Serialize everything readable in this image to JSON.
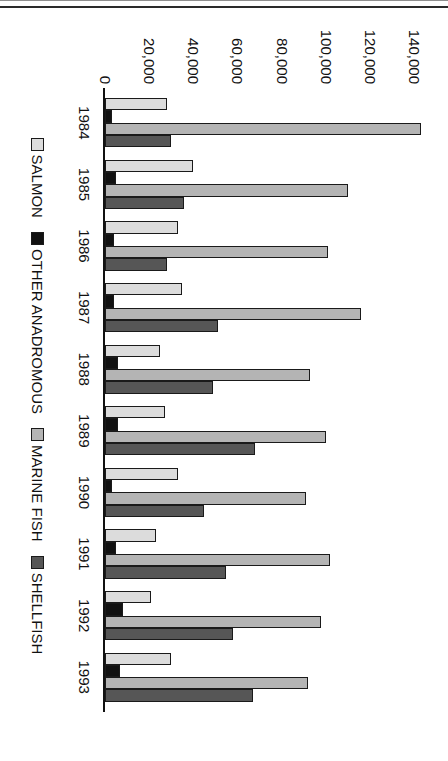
{
  "chart_data": {
    "type": "bar",
    "orientation": "horizontal",
    "title": "",
    "xlabel": "",
    "ylabel": "",
    "categories": [
      "1984",
      "1985",
      "1986",
      "1987",
      "1988",
      "1989",
      "1990",
      "1991",
      "1992",
      "1993"
    ],
    "value_axis_ticks": [
      "0",
      "20,000",
      "40,000",
      "60,000",
      "80,000",
      "100,000",
      "120,000",
      "140,000"
    ],
    "value_axis_tick_values": [
      0,
      20000,
      40000,
      60000,
      80000,
      100000,
      120000,
      140000
    ],
    "ylim": [
      0,
      145000
    ],
    "grid": false,
    "legend_position": "bottom",
    "series": [
      {
        "name": "SALMON",
        "color": "#dcdcdc",
        "values": [
          28000,
          40000,
          33000,
          35000,
          25000,
          27000,
          33000,
          23000,
          21000,
          30000
        ]
      },
      {
        "name": "OTHER ANADROMOUS",
        "color": "#111111",
        "values": [
          3000,
          5000,
          4000,
          4000,
          6000,
          6000,
          3000,
          5000,
          8000,
          7000
        ]
      },
      {
        "name": "MARINE FISH",
        "color": "#b4b4b4",
        "values": [
          143000,
          110000,
          101000,
          116000,
          93000,
          100000,
          91000,
          102000,
          98000,
          92000
        ]
      },
      {
        "name": "SHELLFISH",
        "color": "#565656",
        "values": [
          30000,
          36000,
          28000,
          51000,
          49000,
          68000,
          45000,
          55000,
          58000,
          67000
        ]
      }
    ]
  },
  "legend": {
    "items": [
      {
        "label": "SALMON",
        "swatch": "salmon"
      },
      {
        "label": "OTHER ANADROMOUS",
        "swatch": "anadromous"
      },
      {
        "label": "MARINE FISH",
        "swatch": "marine"
      },
      {
        "label": "SHELLFISH",
        "swatch": "shellfish"
      }
    ]
  }
}
